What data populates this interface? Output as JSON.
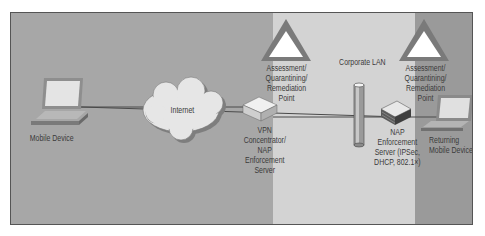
{
  "diagram": {
    "type": "network-topology",
    "zones": [
      {
        "name": "internet-zone",
        "color": "#a7a7a7"
      },
      {
        "name": "corporate-lan",
        "label": "Corporate LAN",
        "color": "#d3d3d3"
      },
      {
        "name": "returning-zone",
        "color": "#9a9a9a"
      }
    ],
    "nodes": {
      "mobile_device": {
        "label": "Mobile Device"
      },
      "internet": {
        "label": "Internet"
      },
      "vpn": {
        "lines": [
          "VPN",
          "Concentrator/",
          "NAP",
          "Enforcement",
          "Server"
        ]
      },
      "assessment_left": {
        "lines": [
          "Assessment/",
          "Quarantining/",
          "Remediation",
          "Point"
        ]
      },
      "corporate_lan": {
        "label": "Corporate LAN"
      },
      "nap_server": {
        "lines": [
          "NAP",
          "Enforcement",
          "Server (IPSec,",
          "DHCP, 802.1×)"
        ]
      },
      "assessment_right": {
        "lines": [
          "Assessment/",
          "Quarantining/",
          "Remediation",
          "Point"
        ]
      },
      "returning_device": {
        "lines": [
          "Returning",
          "Mobile Device"
        ]
      }
    },
    "edges": [
      [
        "Mobile Device",
        "Internet"
      ],
      [
        "Internet",
        "VPN Concentrator/NAP Enforcement Server"
      ],
      [
        "VPN Concentrator/NAP Enforcement Server",
        "Corporate LAN"
      ],
      [
        "Corporate LAN",
        "NAP Enforcement Server"
      ],
      [
        "NAP Enforcement Server",
        "Returning Mobile Device"
      ]
    ]
  }
}
